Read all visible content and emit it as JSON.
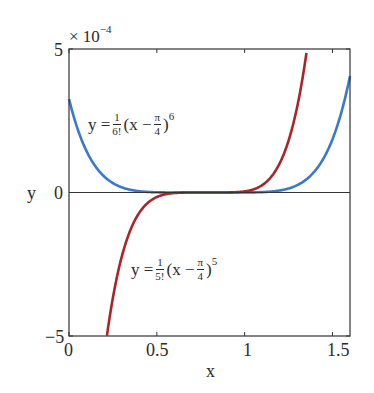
{
  "chart_data": {
    "type": "line",
    "title": "",
    "xlabel": "x",
    "ylabel": "y",
    "xlim": [
      0,
      1.6
    ],
    "ylim": [
      -5,
      5
    ],
    "y_scale_label": "× 10^-4",
    "y_multiplier": 0.0001,
    "x_ticks": [
      0,
      0.5,
      1,
      1.5
    ],
    "x_tick_labels": [
      "0",
      "0.5",
      "1",
      "1.5"
    ],
    "y_ticks": [
      -5,
      0,
      5
    ],
    "y_tick_labels": [
      "−5",
      "0",
      "5"
    ],
    "grid": false,
    "legend": "none (inline curve annotations)",
    "zero_line": true,
    "series": [
      {
        "name": "y = (1/6!)(x − π/4)^6",
        "color": "#3a78c9",
        "formula": "(x - pi/4)^6 / 720",
        "x": [
          0,
          0.1,
          0.2,
          0.3,
          0.4,
          0.5,
          0.6,
          0.7,
          0.785,
          0.9,
          1.0,
          1.1,
          1.2,
          1.3,
          1.4,
          1.5,
          1.6
        ],
        "values_e-4": [
          3.26,
          1.42,
          0.56,
          0.18,
          0.046,
          0.0075,
          0.0006,
          0.0,
          0.0,
          0.0,
          0.0014,
          0.013,
          0.072,
          0.27,
          0.83,
          2.12,
          4.78
        ]
      },
      {
        "name": "y = (1/5!)(x − π/4)^5",
        "color": "#a8262a",
        "formula": "(x - pi/4)^5 / 120",
        "x": [
          0.2,
          0.3,
          0.4,
          0.5,
          0.6,
          0.7,
          0.785,
          0.9,
          1.0,
          1.1,
          1.2,
          1.3,
          1.35
        ],
        "values_e-4": [
          -5.7,
          -2.25,
          -0.71,
          -0.158,
          -0.018,
          -0.0004,
          0.0,
          0.0016,
          0.039,
          0.26,
          1.04,
          3.12,
          4.96
        ]
      }
    ],
    "annotations": [
      {
        "text": "y = (1/6!)(x − π/4)^6",
        "near": "blue curve, upper left"
      },
      {
        "text": "y = (1/5!)(x − π/4)^5",
        "near": "red curve, lower middle"
      }
    ]
  },
  "labels": {
    "ytick_top": "5",
    "ytick_zero": "0",
    "ytick_bottom": "−5",
    "xtick_0": "0",
    "xtick_05": "0.5",
    "xtick_1": "1",
    "xtick_15": "1.5",
    "xlabel": "x",
    "ylabel": "y",
    "multiplier_base": "× 10",
    "multiplier_exp": "−4",
    "eq6": {
      "lhs": "y =",
      "num": "1",
      "den": "6!",
      "mid": "(x −",
      "pi": "π",
      "four": "4",
      "close": ")",
      "exp": "6"
    },
    "eq5": {
      "lhs": "y =",
      "num": "1",
      "den": "5!",
      "mid": "(x −",
      "pi": "π",
      "four": "4",
      "close": ")",
      "exp": "5"
    }
  },
  "colors": {
    "axis": "#333333",
    "blue": "#3a78c9",
    "red": "#a8262a"
  }
}
